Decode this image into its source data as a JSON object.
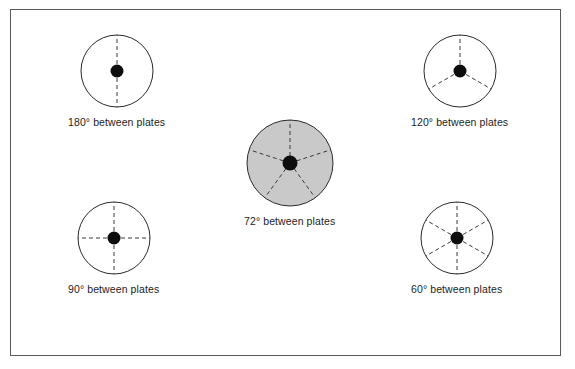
{
  "figure": {
    "border_color": "#5a5a5a",
    "background_color": "#ffffff"
  },
  "style": {
    "circle_stroke": "#2b2b2b",
    "spoke_stroke": "#3a3a3a",
    "hub_color": "#0d0d0d",
    "shaded_fill": "#c9c9c9",
    "unshaded_fill": "#ffffff",
    "label_color": "#1d1d1d"
  },
  "diagrams": [
    {
      "id": "plates-180",
      "label": "180° between plates",
      "angle_degrees": 180,
      "plate_count": 2,
      "spoke_angles": [
        0,
        180
      ],
      "shaded": false,
      "radius": 36,
      "hub_radius": 6.5,
      "position": {
        "left": 57,
        "top": 23
      }
    },
    {
      "id": "plates-120",
      "label": "120° between plates",
      "angle_degrees": 120,
      "plate_count": 3,
      "spoke_angles": [
        0,
        120,
        240
      ],
      "shaded": false,
      "radius": 36,
      "hub_radius": 6.5,
      "position": {
        "left": 400,
        "top": 23
      }
    },
    {
      "id": "plates-72",
      "label": "72° between plates",
      "angle_degrees": 72,
      "plate_count": 5,
      "spoke_angles": [
        0,
        72,
        144,
        216,
        288
      ],
      "shaded": true,
      "radius": 43,
      "hub_radius": 7.5,
      "position": {
        "left": 233,
        "top": 108
      }
    },
    {
      "id": "plates-90",
      "label": "90° between plates",
      "angle_degrees": 90,
      "plate_count": 4,
      "spoke_angles": [
        0,
        90,
        180,
        270
      ],
      "shaded": false,
      "radius": 36,
      "hub_radius": 6.5,
      "position": {
        "left": 57,
        "top": 190
      }
    },
    {
      "id": "plates-60",
      "label": "60° between plates",
      "angle_degrees": 60,
      "plate_count": 6,
      "spoke_angles": [
        0,
        60,
        120,
        180,
        240,
        300
      ],
      "shaded": false,
      "radius": 36,
      "hub_radius": 6.5,
      "position": {
        "left": 400,
        "top": 190
      }
    }
  ]
}
